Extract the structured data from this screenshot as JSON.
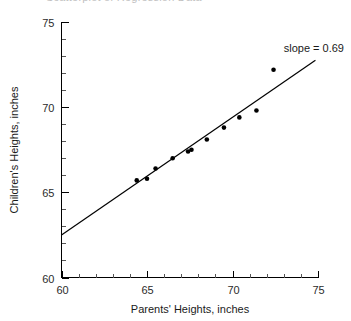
{
  "figure": {
    "title_remnant": "Scatterplot of Regression Data",
    "background_color": "#ffffff",
    "axis_color": "#000000",
    "point_color": "#000000",
    "line_color": "#000000"
  },
  "chart_data": {
    "type": "scatter",
    "title": "",
    "xlabel": "Parents' Heights, inches",
    "ylabel": "Children's Heights, inches",
    "xlim": [
      60,
      75
    ],
    "ylim": [
      60,
      75
    ],
    "xticks": [
      60,
      65,
      70,
      75
    ],
    "yticks": [
      60,
      65,
      70,
      75
    ],
    "xtick_labels": [
      "60",
      "65",
      "70",
      "75"
    ],
    "ytick_labels": [
      "60",
      "65",
      "70",
      "75"
    ],
    "minor_tick_interval": 1,
    "grid": false,
    "legend": false,
    "points": [
      {
        "x": 64.4,
        "y": 65.7
      },
      {
        "x": 65.0,
        "y": 65.8
      },
      {
        "x": 65.5,
        "y": 66.4
      },
      {
        "x": 66.5,
        "y": 67.0
      },
      {
        "x": 67.4,
        "y": 67.4
      },
      {
        "x": 67.6,
        "y": 67.5
      },
      {
        "x": 68.5,
        "y": 68.1
      },
      {
        "x": 69.5,
        "y": 68.8
      },
      {
        "x": 70.4,
        "y": 69.4
      },
      {
        "x": 71.4,
        "y": 69.8
      },
      {
        "x": 72.4,
        "y": 72.2
      }
    ],
    "x_values": [
      64.4,
      65.0,
      65.5,
      66.5,
      67.4,
      67.6,
      68.5,
      69.5,
      70.4,
      71.4,
      72.4
    ],
    "y_values": [
      65.7,
      65.8,
      66.4,
      67.0,
      67.4,
      67.5,
      68.1,
      68.8,
      69.4,
      69.8,
      72.2
    ],
    "point_count": 11,
    "fit_line": {
      "slope": 0.69,
      "label": "slope = 0.69",
      "x_start": 60.0,
      "y_start": 62.5,
      "x_end": 74.85,
      "y_end": 72.75
    },
    "annotations": [
      {
        "text": "slope = 0.69",
        "x": 72.2,
        "y": 73.8
      }
    ]
  }
}
